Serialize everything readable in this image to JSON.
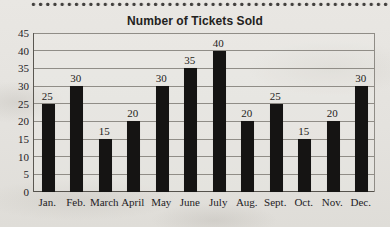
{
  "page": {
    "background_color": "#e4e2de",
    "decoration": "dotted-rule-top"
  },
  "chart_data": {
    "type": "bar",
    "title": "Number of Tickets Sold",
    "categories": [
      "Jan.",
      "Feb.",
      "March",
      "April",
      "May",
      "June",
      "July",
      "Aug.",
      "Sept.",
      "Oct.",
      "Nov.",
      "Dec."
    ],
    "values": [
      25,
      30,
      15,
      20,
      30,
      35,
      40,
      20,
      25,
      15,
      20,
      30
    ],
    "data_labels_shown": true,
    "xlabel": "",
    "ylabel": "",
    "ylim": [
      0,
      45
    ],
    "ytick_step": 5,
    "grid": true,
    "legend": "none",
    "bar_color": "#151413",
    "grid_color": "#908d87",
    "axis_color": "#55524c",
    "text_color": "#24221f"
  }
}
